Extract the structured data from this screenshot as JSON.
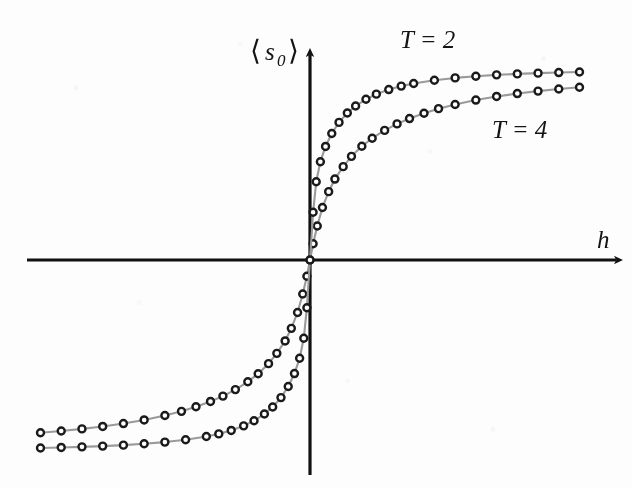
{
  "chart_data": {
    "type": "scatter",
    "title": "",
    "subtitle": "",
    "xlabel": "h",
    "ylabel": "⟨s₀⟩",
    "ylabel_parts": {
      "open_bracket": "⟨",
      "symbol": "s",
      "subscript": "0",
      "close_bracket": "⟩"
    },
    "grid": false,
    "legend_position": "inline-annotation",
    "axes_style": "arrows-through-origin",
    "ticks": {
      "x": [],
      "y": []
    },
    "xlim": [
      -13.5,
      13.5
    ],
    "ylim": [
      -1.05,
      1.05
    ],
    "origin_px": {
      "x": 310,
      "y": 260
    },
    "annotations": [
      {
        "text": "T = 2",
        "series": "T = 2",
        "x_px": 400,
        "y_px": 48
      },
      {
        "text": "T = 4",
        "series": "T = 4",
        "x_px": 492,
        "y_px": 138
      }
    ],
    "series": [
      {
        "name": "T = 2",
        "label": "T = 2",
        "temperature": 2,
        "marker": "circle-open",
        "marker_face": "#ffffff",
        "marker_edge": "#1a1a1a",
        "line_color": "#9a9a9a",
        "x": [
          -13.0,
          -12.0,
          -11.0,
          -10.0,
          -9.0,
          -8.0,
          -7.0,
          -6.0,
          -5.0,
          -4.4,
          -3.8,
          -3.2,
          -2.7,
          -2.2,
          -1.8,
          -1.4,
          -1.05,
          -0.75,
          -0.5,
          -0.3,
          -0.15,
          0.0,
          0.15,
          0.3,
          0.5,
          0.75,
          1.05,
          1.4,
          1.8,
          2.2,
          2.7,
          3.2,
          3.8,
          4.4,
          5.0,
          6.0,
          7.0,
          8.0,
          9.0,
          10.0,
          11.0,
          12.0,
          13.0
        ],
        "y": [
          -0.985,
          -0.982,
          -0.979,
          -0.975,
          -0.97,
          -0.963,
          -0.954,
          -0.942,
          -0.925,
          -0.911,
          -0.893,
          -0.869,
          -0.842,
          -0.807,
          -0.77,
          -0.721,
          -0.663,
          -0.595,
          -0.515,
          -0.41,
          -0.25,
          0.0,
          0.25,
          0.41,
          0.515,
          0.595,
          0.663,
          0.721,
          0.77,
          0.807,
          0.842,
          0.869,
          0.893,
          0.911,
          0.925,
          0.942,
          0.954,
          0.963,
          0.97,
          0.975,
          0.979,
          0.982,
          0.985
        ]
      },
      {
        "name": "T = 4",
        "label": "T = 4",
        "temperature": 4,
        "marker": "circle-open",
        "marker_face": "#ffffff",
        "marker_edge": "#1a1a1a",
        "line_color": "#9a9a9a",
        "x": [
          -13.0,
          -12.0,
          -11.0,
          -10.0,
          -9.0,
          -8.0,
          -7.0,
          -6.2,
          -5.5,
          -4.8,
          -4.2,
          -3.6,
          -3.0,
          -2.5,
          -2.0,
          -1.6,
          -1.2,
          -0.9,
          -0.6,
          -0.35,
          -0.15,
          0.0,
          0.15,
          0.35,
          0.6,
          0.9,
          1.2,
          1.6,
          2.0,
          2.5,
          3.0,
          3.6,
          4.2,
          4.8,
          5.5,
          6.2,
          7.0,
          8.0,
          9.0,
          10.0,
          11.0,
          12.0,
          13.0
        ],
        "y": [
          -0.905,
          -0.896,
          -0.885,
          -0.872,
          -0.857,
          -0.838,
          -0.815,
          -0.793,
          -0.769,
          -0.741,
          -0.713,
          -0.679,
          -0.638,
          -0.596,
          -0.543,
          -0.489,
          -0.424,
          -0.358,
          -0.275,
          -0.178,
          -0.085,
          0.0,
          0.085,
          0.178,
          0.275,
          0.358,
          0.424,
          0.489,
          0.543,
          0.596,
          0.638,
          0.679,
          0.713,
          0.741,
          0.769,
          0.793,
          0.815,
          0.838,
          0.857,
          0.872,
          0.885,
          0.896,
          0.905
        ]
      }
    ],
    "colors": {
      "axis": "#111111",
      "line": "#9a9a9a",
      "marker_edge": "#1a1a1a",
      "marker_face": "#ffffff",
      "text": "#141414",
      "background": "#fdfdfd"
    }
  }
}
